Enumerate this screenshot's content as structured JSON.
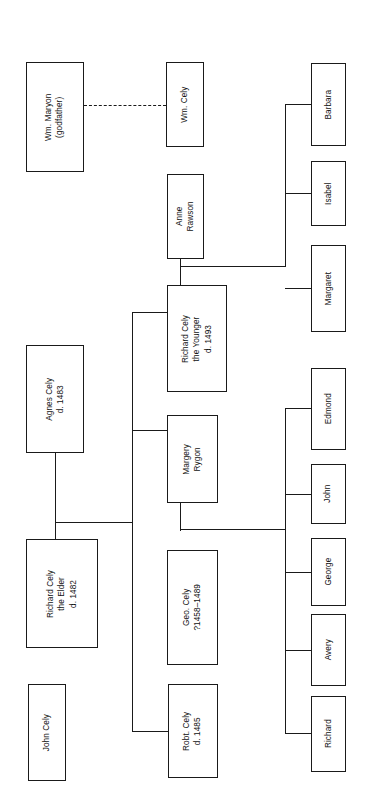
{
  "diagram": {
    "kind": "family-tree",
    "orientation": "rotated-90-ccw",
    "line_color": "#1a1a1a",
    "box_border_color": "#1a1a1a",
    "background_color": "#ffffff"
  },
  "nodes": [
    {
      "id": "wm-maryon",
      "name": "wm-maryon",
      "lines": [
        "Wm. Maryon",
        "(godfather)"
      ],
      "x": 26,
      "y": 62,
      "w": 58,
      "h": 110
    },
    {
      "id": "wm-cely",
      "name": "wm-cely",
      "lines": [
        "Wm. Cely"
      ],
      "x": 166,
      "y": 62,
      "w": 38,
      "h": 85
    },
    {
      "id": "anne-rawson",
      "name": "anne-rawson",
      "lines": [
        "Anne",
        "Rawson"
      ],
      "x": 167,
      "y": 174,
      "w": 37,
      "h": 85
    },
    {
      "id": "barbara",
      "name": "barbara",
      "lines": [
        "Barbara"
      ],
      "x": 311,
      "y": 63,
      "w": 35,
      "h": 83
    },
    {
      "id": "isabel",
      "name": "isabel",
      "lines": [
        "Isabel"
      ],
      "x": 311,
      "y": 161,
      "w": 35,
      "h": 65
    },
    {
      "id": "margaret",
      "name": "margaret",
      "lines": [
        "Margaret"
      ],
      "x": 311,
      "y": 245,
      "w": 35,
      "h": 87
    },
    {
      "id": "richard-cely-younger",
      "name": "richard-cely-the-younger",
      "lines": [
        "Richard Cely",
        "the Younger",
        "d. 1493"
      ],
      "x": 167,
      "y": 285,
      "w": 60,
      "h": 107
    },
    {
      "id": "agnes-cely",
      "name": "agnes-cely",
      "lines": [
        "Agnes Cely",
        "d. 1483"
      ],
      "x": 26,
      "y": 345,
      "w": 58,
      "h": 108
    },
    {
      "id": "margery-rygon",
      "name": "margery-rygon",
      "lines": [
        "Margery",
        "Rygon"
      ],
      "x": 167,
      "y": 415,
      "w": 51,
      "h": 88
    },
    {
      "id": "edmond",
      "name": "edmond",
      "lines": [
        "Edmond"
      ],
      "x": 311,
      "y": 368,
      "w": 35,
      "h": 82
    },
    {
      "id": "john",
      "name": "john",
      "lines": [
        "John"
      ],
      "x": 311,
      "y": 464,
      "w": 35,
      "h": 60
    },
    {
      "id": "george",
      "name": "george",
      "lines": [
        "George"
      ],
      "x": 311,
      "y": 538,
      "w": 35,
      "h": 68
    },
    {
      "id": "avery",
      "name": "avery",
      "lines": [
        "Avery"
      ],
      "x": 311,
      "y": 614,
      "w": 35,
      "h": 72
    },
    {
      "id": "richard",
      "name": "richard",
      "lines": [
        "Richard"
      ],
      "x": 311,
      "y": 696,
      "w": 35,
      "h": 76
    },
    {
      "id": "richard-cely-elder",
      "name": "richard-cely-the-elder",
      "lines": [
        "Richard Cely",
        "the Elder",
        "d. 1482"
      ],
      "x": 26,
      "y": 539,
      "w": 72,
      "h": 109
    },
    {
      "id": "geo-cely",
      "name": "geo-cely",
      "lines": [
        "Geo. Cely",
        "?1458–1489"
      ],
      "x": 167,
      "y": 550,
      "w": 51,
      "h": 115
    },
    {
      "id": "john-cely",
      "name": "john-cely",
      "lines": [
        "John Cely"
      ],
      "x": 28,
      "y": 684,
      "w": 38,
      "h": 97
    },
    {
      "id": "robt-cely",
      "name": "robt-cely",
      "lines": [
        "Robt. Cely",
        "d. 1485"
      ],
      "x": 168,
      "y": 684,
      "w": 50,
      "h": 94
    }
  ],
  "connectors": [
    {
      "name": "godfather-link",
      "kind": "dashed-h",
      "x": 84,
      "y": 105,
      "w": 82
    },
    {
      "name": "marriage-drop-elder",
      "kind": "v",
      "x": 55,
      "y": 453,
      "h": 86
    },
    {
      "name": "marriage-bus-elder",
      "kind": "h",
      "x": 55,
      "y": 522,
      "w": 77
    },
    {
      "name": "sibling-bus-main",
      "kind": "v",
      "x": 132,
      "y": 312,
      "h": 211
    },
    {
      "name": "branch-richard-younger",
      "kind": "h",
      "x": 132,
      "y": 312,
      "w": 35
    },
    {
      "name": "branch-geo-cely",
      "kind": "h",
      "x": 132,
      "y": 430,
      "w": 35
    },
    {
      "name": "branch-robt-cely",
      "kind": "h",
      "x": 132,
      "y": 731,
      "w": 36
    },
    {
      "name": "sibling-bus-lower",
      "kind": "v",
      "x": 132,
      "y": 430,
      "h": 301
    },
    {
      "name": "anne-drop",
      "kind": "v",
      "x": 180,
      "y": 259,
      "h": 27
    },
    {
      "name": "anne-union-bus",
      "kind": "h",
      "x": 180,
      "y": 266,
      "w": 106
    },
    {
      "name": "children-bus-upper",
      "kind": "v",
      "x": 285,
      "y": 104,
      "h": 162
    },
    {
      "name": "branch-barbara",
      "kind": "h",
      "x": 285,
      "y": 104,
      "w": 26
    },
    {
      "name": "branch-isabel",
      "kind": "h",
      "x": 285,
      "y": 193,
      "w": 26
    },
    {
      "name": "branch-margaret",
      "kind": "h",
      "x": 285,
      "y": 288,
      "w": 26
    },
    {
      "name": "margery-drop",
      "kind": "v",
      "x": 180,
      "y": 503,
      "h": 28
    },
    {
      "name": "margery-union-bus",
      "kind": "h",
      "x": 180,
      "y": 529,
      "w": 106
    },
    {
      "name": "children-bus-lower",
      "kind": "v",
      "x": 285,
      "y": 408,
      "h": 326
    },
    {
      "name": "branch-edmond",
      "kind": "h",
      "x": 285,
      "y": 408,
      "w": 26
    },
    {
      "name": "branch-john",
      "kind": "h",
      "x": 285,
      "y": 494,
      "w": 26
    },
    {
      "name": "branch-george",
      "kind": "h",
      "x": 285,
      "y": 572,
      "w": 26
    },
    {
      "name": "branch-avery",
      "kind": "h",
      "x": 285,
      "y": 650,
      "w": 26
    },
    {
      "name": "branch-richard",
      "kind": "h",
      "x": 285,
      "y": 733,
      "w": 26
    }
  ]
}
